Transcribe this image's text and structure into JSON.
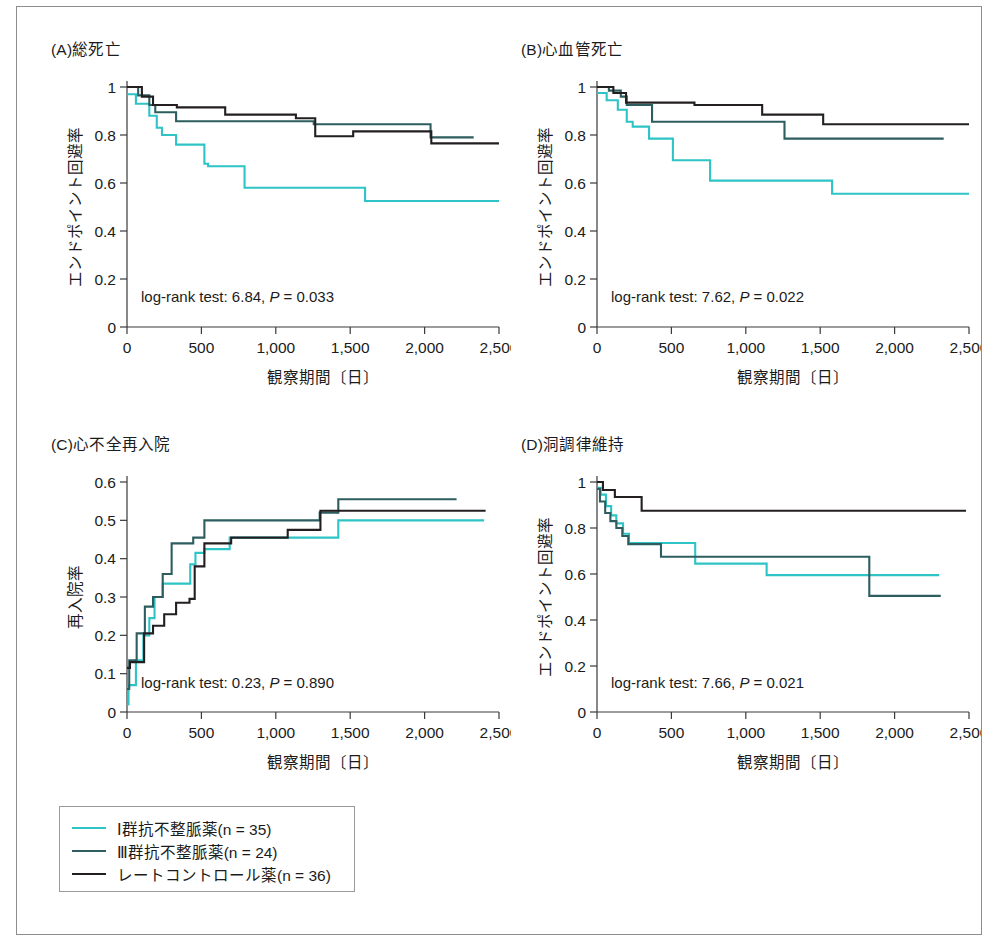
{
  "figure": {
    "background": "#ffffff",
    "border_color": "#8d8d8d"
  },
  "series_styles": [
    {
      "key": "class_I",
      "color": "#2ec4c6",
      "label": "I 群抗不整脈薬",
      "n": 35
    },
    {
      "key": "class_III",
      "color": "#2d5d5f",
      "label": "III 群抗不整脈薬",
      "n": 24
    },
    {
      "key": "rate",
      "color": "#231f20",
      "label": "レートコントロール薬",
      "n": 36
    }
  ],
  "legend": {
    "items": [
      {
        "label": "Ⅰ群抗不整脈薬",
        "n_text": "(n = 35)",
        "color": "#2ec4c6"
      },
      {
        "label": "Ⅲ群抗不整脈薬",
        "n_text": "(n = 24)",
        "color": "#2d5d5f"
      },
      {
        "label": "レートコントロール薬",
        "n_text": "(n = 36)",
        "color": "#231f20"
      }
    ]
  },
  "panels": [
    {
      "id": "A",
      "title": "(A)総死亡",
      "xlabel": "観察期間〔日〕",
      "ylabel": "エンドポイント回避率",
      "stat_prefix": "log-rank test: 6.84, ",
      "stat_p_italic": "P",
      "stat_suffix": " = 0.033",
      "logrank": 6.84,
      "p_value": 0.033,
      "xlim": [
        0,
        2500
      ],
      "ylim": [
        0,
        1
      ],
      "xticks": [
        0,
        500,
        1000,
        1500,
        2000,
        2500
      ],
      "xticklabels": [
        "0",
        "500",
        "1,000",
        "1,500",
        "2,000",
        "2,500"
      ],
      "yticks": [
        0,
        0.2,
        0.4,
        0.6,
        0.8,
        1
      ],
      "yticklabels": [
        "0",
        "0.2",
        "0.4",
        "0.6",
        "0.8",
        "1"
      ],
      "curves": [
        {
          "key": "class_I",
          "color": "#2ec4c6",
          "x": [
            0,
            60,
            60,
            150,
            150,
            200,
            200,
            235,
            235,
            330,
            330,
            520,
            520,
            545,
            545,
            790,
            790,
            1600,
            1600,
            2500
          ],
          "y": [
            0.97,
            0.97,
            0.93,
            0.93,
            0.88,
            0.88,
            0.83,
            0.83,
            0.8,
            0.8,
            0.76,
            0.76,
            0.68,
            0.68,
            0.67,
            0.67,
            0.58,
            0.58,
            0.525,
            0.525
          ]
        },
        {
          "key": "class_III",
          "color": "#2d5d5f",
          "x": [
            0,
            75,
            75,
            150,
            150,
            190,
            190,
            330,
            330,
            1255,
            1255,
            2040,
            2040,
            2330
          ],
          "y": [
            1.0,
            1.0,
            0.965,
            0.965,
            0.925,
            0.925,
            0.895,
            0.895,
            0.857,
            0.857,
            0.845,
            0.845,
            0.79,
            0.79
          ]
        },
        {
          "key": "rate",
          "color": "#231f20",
          "x": [
            0,
            100,
            100,
            175,
            175,
            335,
            335,
            660,
            660,
            1135,
            1135,
            1265,
            1265,
            1520,
            1520,
            2045,
            2045,
            2500
          ],
          "y": [
            1.0,
            1.0,
            0.96,
            0.96,
            0.925,
            0.925,
            0.915,
            0.915,
            0.885,
            0.885,
            0.87,
            0.87,
            0.795,
            0.795,
            0.815,
            0.815,
            0.765,
            0.765
          ]
        }
      ]
    },
    {
      "id": "B",
      "title": "(B)心血管死亡",
      "xlabel": "観察期間〔日〕",
      "ylabel": "エンドポイント回避率",
      "stat_prefix": "log-rank test: 7.62, ",
      "stat_p_italic": "P",
      "stat_suffix": " = 0.022",
      "logrank": 7.62,
      "p_value": 0.022,
      "xlim": [
        0,
        2500
      ],
      "ylim": [
        0,
        1
      ],
      "xticks": [
        0,
        500,
        1000,
        1500,
        2000,
        2500
      ],
      "xticklabels": [
        "0",
        "500",
        "1,000",
        "1,500",
        "2,000",
        "2,500"
      ],
      "yticks": [
        0,
        0.2,
        0.4,
        0.6,
        0.8,
        1
      ],
      "yticklabels": [
        "0",
        "0.2",
        "0.4",
        "0.6",
        "0.8",
        "1"
      ],
      "curves": [
        {
          "key": "class_I",
          "color": "#2ec4c6",
          "x": [
            0,
            65,
            65,
            140,
            140,
            200,
            200,
            240,
            240,
            350,
            350,
            510,
            510,
            760,
            760,
            1580,
            1580,
            2500
          ],
          "y": [
            0.975,
            0.975,
            0.945,
            0.945,
            0.905,
            0.905,
            0.855,
            0.855,
            0.835,
            0.835,
            0.785,
            0.785,
            0.695,
            0.695,
            0.61,
            0.61,
            0.555,
            0.555
          ]
        },
        {
          "key": "class_III",
          "color": "#2d5d5f",
          "x": [
            0,
            80,
            80,
            160,
            160,
            200,
            200,
            370,
            370,
            1260,
            1260,
            2330
          ],
          "y": [
            1.0,
            1.0,
            0.985,
            0.985,
            0.96,
            0.96,
            0.925,
            0.925,
            0.855,
            0.855,
            0.785,
            0.785
          ]
        },
        {
          "key": "rate",
          "color": "#231f20",
          "x": [
            0,
            110,
            110,
            195,
            195,
            655,
            655,
            1110,
            1110,
            1520,
            1520,
            2500
          ],
          "y": [
            1.0,
            1.0,
            0.975,
            0.975,
            0.935,
            0.935,
            0.925,
            0.925,
            0.885,
            0.885,
            0.845,
            0.845
          ]
        }
      ]
    },
    {
      "id": "C",
      "title": "(C)心不全再入院",
      "xlabel": "観察期間〔日〕",
      "ylabel": "再入院率",
      "stat_prefix": "log-rank test: 0.23, ",
      "stat_p_italic": "P",
      "stat_suffix": " = 0.890",
      "logrank": 0.23,
      "p_value": 0.89,
      "xlim": [
        0,
        2500
      ],
      "ylim": [
        0,
        0.6
      ],
      "xticks": [
        0,
        500,
        1000,
        1500,
        2000,
        2500
      ],
      "xticklabels": [
        "0",
        "500",
        "1,000",
        "1,500",
        "2,000",
        "2,500"
      ],
      "yticks": [
        0,
        0.1,
        0.2,
        0.3,
        0.4,
        0.5,
        0.6
      ],
      "yticklabels": [
        "0",
        "0.1",
        "0.2",
        "0.3",
        "0.4",
        "0.5",
        "0.6"
      ],
      "curves": [
        {
          "key": "class_I",
          "color": "#2ec4c6",
          "x": [
            0,
            10,
            10,
            60,
            60,
            110,
            110,
            150,
            150,
            185,
            185,
            240,
            240,
            425,
            425,
            460,
            460,
            520,
            520,
            690,
            690,
            1280,
            1280,
            1420,
            1420,
            2400
          ],
          "y": [
            0.02,
            0.02,
            0.07,
            0.07,
            0.135,
            0.135,
            0.2,
            0.2,
            0.245,
            0.245,
            0.3,
            0.3,
            0.335,
            0.335,
            0.385,
            0.385,
            0.415,
            0.415,
            0.425,
            0.425,
            0.455,
            0.455,
            0.455,
            0.455,
            0.5,
            0.5
          ]
        },
        {
          "key": "class_III",
          "color": "#2d5d5f",
          "x": [
            0,
            15,
            15,
            65,
            65,
            120,
            120,
            175,
            175,
            240,
            240,
            300,
            300,
            445,
            445,
            520,
            520,
            1295,
            1295,
            1420,
            1420,
            2215
          ],
          "y": [
            0.06,
            0.06,
            0.135,
            0.135,
            0.205,
            0.205,
            0.275,
            0.275,
            0.3,
            0.3,
            0.36,
            0.36,
            0.44,
            0.44,
            0.455,
            0.455,
            0.5,
            0.5,
            0.52,
            0.52,
            0.555,
            0.555
          ]
        },
        {
          "key": "rate",
          "color": "#231f20",
          "x": [
            0,
            20,
            20,
            115,
            115,
            175,
            175,
            250,
            250,
            330,
            330,
            420,
            420,
            455,
            455,
            520,
            520,
            700,
            700,
            1080,
            1080,
            1300,
            1300,
            2410
          ],
          "y": [
            0.115,
            0.115,
            0.13,
            0.13,
            0.205,
            0.205,
            0.225,
            0.225,
            0.255,
            0.255,
            0.285,
            0.285,
            0.295,
            0.295,
            0.38,
            0.38,
            0.44,
            0.44,
            0.455,
            0.455,
            0.475,
            0.475,
            0.525,
            0.525
          ]
        }
      ]
    },
    {
      "id": "D",
      "title": "(D)洞調律維持",
      "xlabel": "観察期間〔日〕",
      "ylabel": "エンドポイント回避率",
      "stat_prefix": "log-rank test: 7.66, ",
      "stat_p_italic": "P",
      "stat_suffix": " = 0.021",
      "logrank": 7.66,
      "p_value": 0.021,
      "xlim": [
        0,
        2500
      ],
      "ylim": [
        0,
        1
      ],
      "xticks": [
        0,
        500,
        1000,
        1500,
        2000,
        2500
      ],
      "xticklabels": [
        "0",
        "500",
        "1,000",
        "1,500",
        "2,000",
        "2,500"
      ],
      "yticks": [
        0,
        0.2,
        0.4,
        0.6,
        0.8,
        1
      ],
      "yticklabels": [
        "0",
        "0.2",
        "0.4",
        "0.6",
        "0.8",
        "1"
      ],
      "curves": [
        {
          "key": "class_I",
          "color": "#2ec4c6",
          "x": [
            0,
            25,
            25,
            60,
            60,
            95,
            95,
            130,
            130,
            175,
            175,
            215,
            215,
            660,
            660,
            1140,
            1140,
            2300
          ],
          "y": [
            0.975,
            0.975,
            0.945,
            0.945,
            0.895,
            0.895,
            0.855,
            0.855,
            0.82,
            0.82,
            0.775,
            0.775,
            0.735,
            0.735,
            0.645,
            0.645,
            0.595,
            0.595
          ]
        },
        {
          "key": "class_III",
          "color": "#2d5d5f",
          "x": [
            0,
            20,
            20,
            55,
            55,
            90,
            90,
            130,
            130,
            170,
            170,
            210,
            210,
            430,
            430,
            1830,
            1830,
            2310
          ],
          "y": [
            0.97,
            0.97,
            0.915,
            0.915,
            0.865,
            0.865,
            0.83,
            0.83,
            0.8,
            0.8,
            0.765,
            0.765,
            0.73,
            0.73,
            0.675,
            0.675,
            0.505,
            0.505
          ]
        },
        {
          "key": "rate",
          "color": "#231f20",
          "x": [
            0,
            40,
            40,
            120,
            120,
            300,
            300,
            2480
          ],
          "y": [
            1.0,
            1.0,
            0.965,
            0.965,
            0.935,
            0.935,
            0.875,
            0.875
          ]
        }
      ]
    }
  ]
}
